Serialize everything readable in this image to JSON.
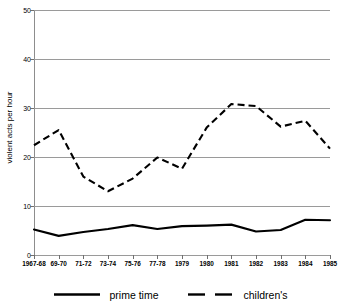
{
  "chart_data": {
    "type": "line",
    "title": "",
    "xlabel": "",
    "ylabel": "violent acts per hour",
    "ylim": [
      0,
      50
    ],
    "yticks": [
      0,
      10,
      20,
      30,
      40,
      50
    ],
    "grid": true,
    "legend_position": "bottom",
    "categories": [
      "1967-68",
      "69-70",
      "71-72",
      "73-74",
      "75-76",
      "77-78",
      "1979",
      "1980",
      "1981",
      "1982",
      "1983",
      "1984",
      "1985"
    ],
    "series": [
      {
        "name": "prime time",
        "style": "solid",
        "color": "#000000",
        "values": [
          5.2,
          3.9,
          4.7,
          5.3,
          6.1,
          5.3,
          5.9,
          6.0,
          6.2,
          4.8,
          5.1,
          7.2,
          7.1
        ]
      },
      {
        "name": "children's",
        "style": "dashed",
        "color": "#000000",
        "values": [
          22.4,
          25.5,
          16.0,
          13.0,
          15.6,
          19.9,
          17.6,
          26.0,
          30.8,
          30.4,
          26.2,
          27.4,
          21.7
        ]
      }
    ]
  },
  "legend": {
    "entries": [
      {
        "label": "prime time",
        "swatch": "solid-line-icon"
      },
      {
        "label": "children's",
        "swatch": "dashed-line-icon"
      }
    ]
  },
  "axis": {
    "y_title": "violent acts per hour",
    "y_tick_labels": [
      "0",
      "10",
      "20",
      "30",
      "40",
      "50"
    ],
    "x_tick_labels": [
      "1967-68",
      "69-70",
      "71-72",
      "73-74",
      "75-76",
      "77-78",
      "1979",
      "1980",
      "1981",
      "1982",
      "1983",
      "1984",
      "1985"
    ]
  },
  "colors": {
    "series_line": "#000000",
    "gridline": "#9a9a9a",
    "axis": "#8d8d8d",
    "background": "#ffffff"
  }
}
